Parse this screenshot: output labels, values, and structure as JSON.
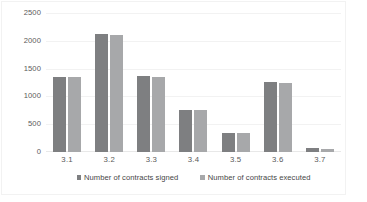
{
  "chart_data": {
    "type": "bar",
    "title": "",
    "subtitle": "",
    "xlabel": "",
    "ylabel": "",
    "categories": [
      "3.1",
      "3.2",
      "3.3",
      "3.4",
      "3.5",
      "3.6",
      "3.7"
    ],
    "series": [
      {
        "name": "Number of contracts signed",
        "color": "#7e7f81",
        "values": [
          1355,
          2125,
          1370,
          760,
          340,
          1255,
          65
        ]
      },
      {
        "name": "Number of contracts executed",
        "color": "#a7a8aa",
        "values": [
          1350,
          2100,
          1350,
          755,
          335,
          1250,
          60
        ]
      }
    ],
    "ylim": [
      0,
      2500
    ],
    "yticks": [
      0,
      500,
      1000,
      1500,
      2000,
      2500
    ],
    "ytick_labels": [
      "0",
      "500",
      "1000",
      "1500",
      "2000",
      "2500"
    ],
    "grid": true,
    "legend_position": "bottom",
    "annotations": []
  },
  "colors": {
    "series_signed": "#7e7f81",
    "series_executed": "#a7a8aa",
    "gridline": "#f2f2f2",
    "axis_text": "#5a5a5a",
    "legend_text": "#464646",
    "background": "#ffffff"
  }
}
